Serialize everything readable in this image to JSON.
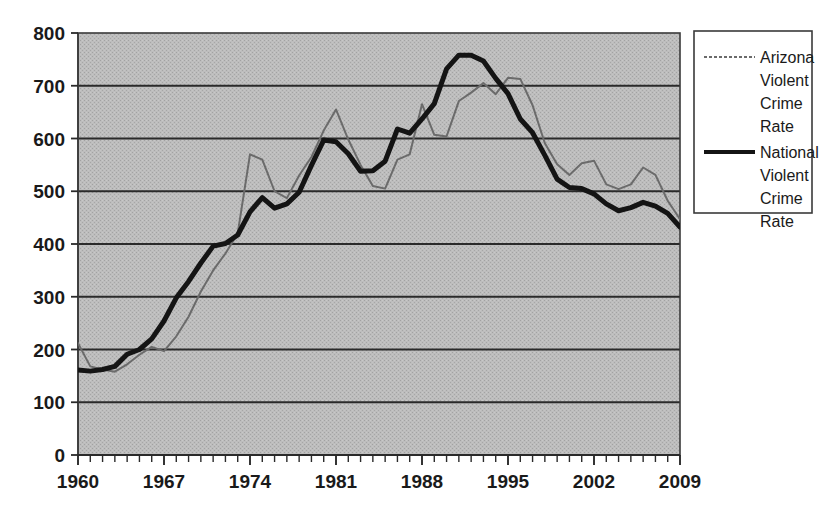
{
  "chart_data": {
    "type": "line",
    "title": "",
    "xlabel": "",
    "ylabel": "",
    "xlim": [
      1960,
      2009
    ],
    "ylim": [
      0,
      800
    ],
    "grid": true,
    "legend_position": "right",
    "y_ticks": [
      0,
      100,
      200,
      300,
      400,
      500,
      600,
      700,
      800
    ],
    "y_tick_labels": [
      "0",
      "100",
      "200",
      "300",
      "400",
      "500",
      "600",
      "700",
      "800"
    ],
    "x_ticks": [
      1960,
      1967,
      1974,
      1981,
      1988,
      1995,
      2002,
      2009
    ],
    "x_tick_labels": [
      "1960",
      "1967",
      "1974",
      "1981",
      "1988",
      "1995",
      "2002",
      "2009"
    ],
    "x_minor_tick_step": 1,
    "x": [
      1960,
      1961,
      1962,
      1963,
      1964,
      1965,
      1966,
      1967,
      1968,
      1969,
      1970,
      1971,
      1972,
      1973,
      1974,
      1975,
      1976,
      1977,
      1978,
      1979,
      1980,
      1981,
      1982,
      1983,
      1984,
      1985,
      1986,
      1987,
      1988,
      1989,
      1990,
      1991,
      1992,
      1993,
      1994,
      1995,
      1996,
      1997,
      1998,
      1999,
      2000,
      2001,
      2002,
      2003,
      2004,
      2005,
      2006,
      2007,
      2008,
      2009
    ],
    "series": [
      {
        "name": "Arizona Violent Crime Rate",
        "color": "#6b6b6b",
        "line_style": "thin-gray",
        "line_width": 2,
        "values": [
          212,
          168,
          162,
          158,
          172,
          190,
          205,
          197,
          225,
          262,
          310,
          350,
          382,
          420,
          570,
          560,
          500,
          487,
          530,
          565,
          615,
          655,
          598,
          550,
          510,
          505,
          560,
          570,
          665,
          607,
          604,
          671,
          687,
          705,
          684,
          715,
          713,
          663,
          591,
          551,
          531,
          553,
          558,
          513,
          504,
          513,
          545,
          531,
          482,
          447
        ]
      },
      {
        "name": "National Violent Crime Rate",
        "color": "#141414",
        "line_style": "thick-black",
        "line_width": 5,
        "values": [
          161,
          159,
          162,
          168,
          191,
          200,
          220,
          254,
          298,
          329,
          364,
          396,
          401,
          417,
          461,
          488,
          468,
          476,
          498,
          549,
          597,
          594,
          571,
          538,
          539,
          557,
          618,
          610,
          637,
          666,
          732,
          758,
          758,
          747,
          714,
          685,
          637,
          611,
          568,
          523,
          507,
          505,
          495,
          476,
          463,
          469,
          479,
          472,
          458,
          432
        ]
      }
    ]
  },
  "legend": {
    "entries": [
      {
        "label_lines": [
          "Arizona",
          "Violent",
          "Crime",
          "Rate"
        ],
        "sample": "thin-gray-line"
      },
      {
        "label_lines": [
          "National",
          "Violent",
          "Crime",
          "Rate"
        ],
        "sample": "thick-black-line"
      }
    ]
  },
  "plot_area": {
    "background_color": "#b4b4b4",
    "border_color": "#333333",
    "gridline_color": "#2a2a2a"
  }
}
